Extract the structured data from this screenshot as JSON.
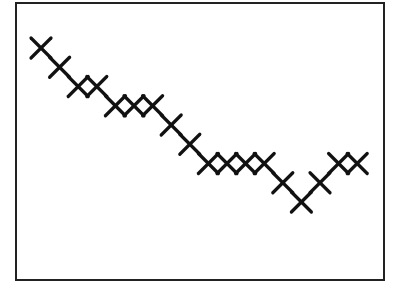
{
  "chart_data": {
    "type": "scatter",
    "title": "",
    "xlabel": "",
    "ylabel": "",
    "marker": "x",
    "grid": false,
    "legend": null,
    "axes_ticks": false,
    "x": [
      1,
      2,
      3,
      4,
      5,
      6,
      7,
      8,
      9,
      10,
      11,
      12,
      13,
      14,
      15,
      16,
      17,
      18
    ],
    "values": [
      8,
      7,
      6,
      6,
      5,
      5,
      5,
      4,
      3,
      2,
      2,
      2,
      2,
      1,
      0,
      1,
      2,
      2
    ],
    "xlim": [
      0,
      19.5
    ],
    "ylim": [
      -4,
      10
    ],
    "colors": {
      "marker": "#111111",
      "frame": "#222222",
      "background": "#ffffff"
    }
  },
  "layout": {
    "frame": {
      "x": 16,
      "y": 3,
      "w": 368,
      "h": 277
    },
    "x0_px": 41,
    "dx_px": 18.6,
    "y_top_px": 48,
    "dy_px": 19.25,
    "marker_half": 10,
    "marker_stroke": 3.2
  }
}
